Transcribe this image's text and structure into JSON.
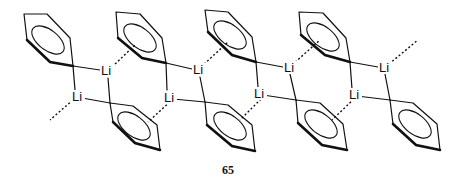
{
  "diagram": {
    "type": "chemical-structure",
    "compound_number": "65",
    "atom_symbol": "Li",
    "top_rings": [
      {
        "points": "24,14 47,14 70,38 73,66 50,62 27,40",
        "bold": "27,40 50,62 73,66",
        "ell": {
          "cx": 48,
          "cy": 40,
          "rx": 19,
          "ry": 10,
          "rot": 38
        }
      },
      {
        "points": "116,12 140,14 162,38 166,63 142,58 118,38",
        "bold": "118,38 142,58 166,63",
        "ell": {
          "cx": 140,
          "cy": 38,
          "rx": 19,
          "ry": 10,
          "rot": 38
        }
      },
      {
        "points": "205,10 228,12 252,37 256,62 232,55 208,32",
        "bold": "208,32 232,55 256,62",
        "ell": {
          "cx": 230,
          "cy": 35,
          "rx": 19,
          "ry": 10,
          "rot": 38
        }
      },
      {
        "points": "299,12 323,13 346,38 350,62 325,55 301,35",
        "bold": "301,35 325,55 350,62",
        "ell": {
          "cx": 323,
          "cy": 37,
          "rx": 19,
          "ry": 10,
          "rot": 38
        }
      }
    ],
    "bottom_rings": [
      {
        "points": "110,103 133,106 157,125 160,150 135,143 113,122",
        "bold": "113,122 135,143 160,150",
        "ell": {
          "cx": 134,
          "cy": 126,
          "rx": 19,
          "ry": 10,
          "rot": 38
        }
      },
      {
        "points": "205,102 228,105 252,125 255,151 232,146 207,125",
        "bold": "207,125 232,146 255,151",
        "ell": {
          "cx": 230,
          "cy": 126,
          "rx": 19,
          "ry": 10,
          "rot": 38
        }
      },
      {
        "points": "296,100 320,103 343,124 347,150 322,145 298,123",
        "bold": "298,123 322,145 347,150",
        "ell": {
          "cx": 321,
          "cy": 124,
          "rx": 19,
          "ry": 10,
          "rot": 38
        }
      },
      {
        "points": "390,100 413,103 437,124 440,150 416,145 393,124",
        "bold": "393,124 416,145 440,150",
        "ell": {
          "cx": 415,
          "cy": 124,
          "rx": 19,
          "ry": 10,
          "rot": 38
        }
      }
    ],
    "li_top": [
      {
        "x": 101,
        "y": 75
      },
      {
        "x": 193,
        "y": 74
      },
      {
        "x": 284,
        "y": 72
      },
      {
        "x": 379,
        "y": 72
      }
    ],
    "li_bottom": [
      {
        "x": 72,
        "y": 101
      },
      {
        "x": 164,
        "y": 102
      },
      {
        "x": 254,
        "y": 98
      },
      {
        "x": 349,
        "y": 99
      }
    ],
    "bonds": [
      "73,66 100,70",
      "166,63 192,69",
      "256,62 283,67",
      "350,62 378,67",
      "73,66 75,90",
      "166,63 167,90",
      "256,62 258,87",
      "350,62 352,89",
      "108,78 110,103",
      "200,77 205,102",
      "290,74 296,100",
      "385,74 390,100",
      "82,98 110,103",
      "173,99 205,102",
      "263,95 296,100",
      "357,96 390,100"
    ],
    "dashed": [
      "112,67 136,44",
      "201,67 228,42",
      "292,65 320,40",
      "389,64 418,40",
      "73,100 50,120",
      "173,99 148,122",
      "264,96 240,120",
      "357,96 332,120"
    ]
  }
}
